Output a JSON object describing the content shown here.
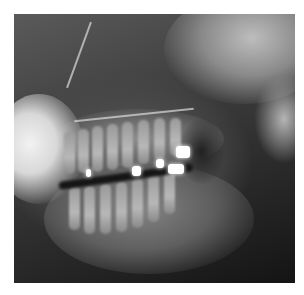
{
  "image": {
    "type": "dental-radiograph",
    "description": "Grayscale lateral/panoramic dental X-ray showing upper and lower teeth in occlusion with several bright metallic fillings",
    "background_color": "#ffffff",
    "frame": {
      "left": 14,
      "top": 14,
      "width": 281,
      "height": 269
    },
    "fillings": [
      {
        "x": 72,
        "y": 155,
        "w": 5,
        "h": 8
      },
      {
        "x": 118,
        "y": 152,
        "w": 9,
        "h": 10
      },
      {
        "x": 142,
        "y": 145,
        "w": 8,
        "h": 9
      },
      {
        "x": 162,
        "y": 132,
        "w": 14,
        "h": 12
      },
      {
        "x": 154,
        "y": 150,
        "w": 16,
        "h": 10
      }
    ]
  }
}
